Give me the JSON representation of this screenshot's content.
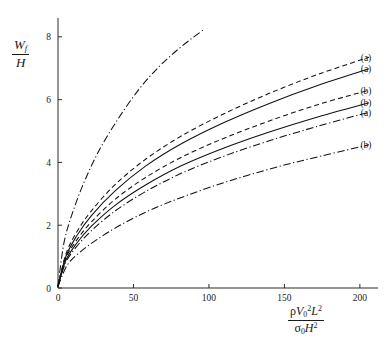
{
  "figure": {
    "background": "#ffffff",
    "ink_color": "#111111"
  },
  "axes": {
    "y_label": {
      "numerator_var": "W",
      "numerator_sub": "f",
      "denominator": "H"
    },
    "x_label": {
      "num_rho": "ρ",
      "num_V": "V",
      "num_V_sub": "0",
      "num_V_sup": "2",
      "num_L": "L",
      "num_L_sup": "2",
      "den_sigma": "σ",
      "den_sigma_sub": "0",
      "den_H": "H",
      "den_H_sup": "2"
    },
    "x_ticks": [
      "0",
      "50",
      "100",
      "150",
      "200"
    ],
    "y_ticks": [
      "0",
      "2",
      "4",
      "6",
      "8"
    ],
    "xlim": [
      0,
      212
    ],
    "ylim": [
      0,
      8.6
    ],
    "grid": false
  },
  "chart_data": {
    "type": "line",
    "title": "",
    "xlabel": "rho V0^2 L^2 / (sigma0 H^2)",
    "ylabel": "Wf / H",
    "xlim": [
      0,
      212
    ],
    "ylim": [
      0,
      8.6
    ],
    "x_ticks": [
      0,
      50,
      100,
      150,
      200
    ],
    "y_ticks": [
      0,
      2,
      4,
      6,
      8
    ],
    "grid": false,
    "legend": "inline-right-end-labels",
    "series": [
      {
        "name": "steep-dashdot-unlabeled",
        "label": "",
        "style": "dashdot",
        "x": [
          0,
          4,
          10,
          18,
          28,
          40,
          54,
          68,
          82,
          97
        ],
        "y": [
          0.05,
          1.45,
          2.45,
          3.45,
          4.45,
          5.4,
          6.35,
          7.1,
          7.7,
          8.25
        ]
      },
      {
        "name": "curve-a-dashed-top",
        "label": "(a)",
        "style": "dashed",
        "x": [
          0,
          5,
          12,
          22,
          38,
          58,
          82,
          110,
          140,
          172,
          206
        ],
        "y": [
          0.05,
          1.05,
          1.75,
          2.45,
          3.3,
          4.1,
          4.85,
          5.55,
          6.2,
          6.8,
          7.35
        ]
      },
      {
        "name": "curve-a-solid-top",
        "label": "(a)",
        "style": "solid",
        "x": [
          0,
          5,
          12,
          22,
          38,
          58,
          82,
          110,
          140,
          172,
          206
        ],
        "y": [
          0.05,
          0.98,
          1.63,
          2.3,
          3.1,
          3.88,
          4.6,
          5.27,
          5.88,
          6.45,
          6.98
        ]
      },
      {
        "name": "curve-b-dashed",
        "label": "(b)",
        "style": "dashed",
        "x": [
          0,
          5,
          12,
          22,
          38,
          58,
          82,
          110,
          140,
          172,
          206
        ],
        "y": [
          0.05,
          0.92,
          1.5,
          2.1,
          2.83,
          3.52,
          4.17,
          4.77,
          5.32,
          5.84,
          6.3
        ]
      },
      {
        "name": "curve-b-solid",
        "label": "(b)",
        "style": "solid",
        "x": [
          0,
          5,
          12,
          22,
          38,
          58,
          82,
          110,
          140,
          172,
          206
        ],
        "y": [
          0.05,
          0.86,
          1.4,
          1.96,
          2.64,
          3.28,
          3.9,
          4.46,
          4.97,
          5.45,
          5.9
        ]
      },
      {
        "name": "curve-a-dashdot",
        "label": "(a)",
        "style": "dashdot",
        "x": [
          0,
          5,
          12,
          22,
          38,
          58,
          82,
          110,
          140,
          172,
          206
        ],
        "y": [
          0.05,
          0.8,
          1.3,
          1.82,
          2.46,
          3.07,
          3.66,
          4.2,
          4.69,
          5.15,
          5.6
        ]
      },
      {
        "name": "curve-b-dashdot-low",
        "label": "(b)",
        "style": "dashdot",
        "x": [
          0,
          6,
          14,
          26,
          42,
          62,
          86,
          114,
          144,
          174,
          206
        ],
        "y": [
          0.05,
          0.72,
          1.12,
          1.55,
          2.02,
          2.5,
          2.96,
          3.42,
          3.84,
          4.2,
          4.56
        ]
      }
    ]
  },
  "end_labels": [
    {
      "text": "(a)",
      "y_value": 7.35
    },
    {
      "text": "(a)",
      "y_value": 6.98
    },
    {
      "text": "(b)",
      "y_value": 6.3
    },
    {
      "text": "(b)",
      "y_value": 5.9
    },
    {
      "text": "(a)",
      "y_value": 5.6
    },
    {
      "text": "(b)",
      "y_value": 4.56
    }
  ]
}
